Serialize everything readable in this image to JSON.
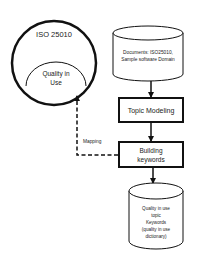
{
  "diagram": {
    "standard_circle": {
      "label": "ISO 25010"
    },
    "inner_ellipse": {
      "line1": "Quality in",
      "line2": "Use"
    },
    "documents_db": {
      "line1": "Documents: ISO25010,",
      "line2": "Sample  software Domain"
    },
    "topic_modeling": {
      "label": "Topic Modeling"
    },
    "building_keywords": {
      "line1": "Building",
      "line2": "keywords"
    },
    "mapping_edge": {
      "label": "Mapping"
    },
    "keywords_db": {
      "line1": "Quality in use",
      "line2": "topic",
      "line3": "Keywords",
      "line4": "(quality in use",
      "line5": "dictionary)"
    },
    "colors": {
      "stroke": "#111111",
      "text": "#222222",
      "background": "#ffffff"
    }
  }
}
